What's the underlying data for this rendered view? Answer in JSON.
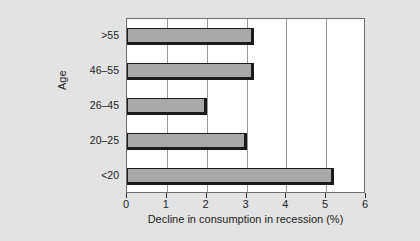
{
  "chart_data": {
    "type": "bar",
    "orientation": "horizontal",
    "title": "",
    "xlabel": "Decline in consumption in recession (%)",
    "ylabel": "Age",
    "categories": [
      "<20",
      "20–25",
      "26–45",
      "46–55",
      ">55"
    ],
    "values": [
      5.2,
      3.0,
      2.0,
      3.2,
      3.2
    ],
    "xlim": [
      0,
      6
    ],
    "xticks": [
      "0",
      "1",
      "2",
      "3",
      "4",
      "5",
      "6"
    ],
    "xtick_values": [
      0,
      1,
      2,
      3,
      4,
      5,
      6
    ],
    "grid": "vertical",
    "legend": "none",
    "colors": {
      "bar_fill": "#a9a9a9",
      "bar_edge": "#1a1a1a",
      "plot_background": "#ffffff",
      "page_background": "#e3e3e3",
      "gridline": "#9a9a9a",
      "frame": "#6d6d6d",
      "text": "#1c1c1c"
    }
  }
}
